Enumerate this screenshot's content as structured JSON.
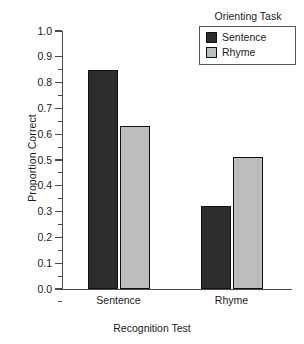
{
  "chart_data": {
    "type": "bar",
    "title": "",
    "xlabel": "Recognition Test",
    "ylabel": "Proportion Correct",
    "categories": [
      "Sentence",
      "Rhyme"
    ],
    "series": [
      {
        "name": "Sentence",
        "values": [
          0.85,
          0.32
        ],
        "color": "#2d2d2d"
      },
      {
        "name": "Rhyme",
        "values": [
          0.63,
          0.51
        ],
        "color": "#bdbdbd"
      }
    ],
    "ylim": [
      0.0,
      1.0
    ],
    "ytick_labels": [
      "0.0",
      "0.1",
      "0.2",
      "0.3",
      "0.4",
      "0.5",
      "0.6",
      "0.7",
      "0.8",
      "0.9",
      "1.0"
    ],
    "ytick_values": [
      0.0,
      0.1,
      0.2,
      0.3,
      0.4,
      0.5,
      0.6,
      0.7,
      0.8,
      0.9,
      1.0
    ],
    "minor_ticks": true,
    "grid": false,
    "legend": {
      "title": "Orienting Task",
      "position": "top-right",
      "entries": [
        {
          "label": "Sentence",
          "color": "#2d2d2d"
        },
        {
          "label": "Rhyme",
          "color": "#bdbdbd"
        }
      ]
    }
  },
  "axes": {
    "y_title": "Proportion Correct",
    "x_title": "Recognition Test",
    "y_ticks": [
      {
        "label": "1.0"
      },
      {
        "label": "0.9"
      },
      {
        "label": "0.8"
      },
      {
        "label": "0.7"
      },
      {
        "label": "0.6"
      },
      {
        "label": "0.5"
      },
      {
        "label": "0.4"
      },
      {
        "label": "0.3"
      },
      {
        "label": "0.2"
      },
      {
        "label": "0.1"
      },
      {
        "label": "0.0"
      }
    ],
    "x_categories": [
      {
        "label": "Sentence"
      },
      {
        "label": "Rhyme"
      }
    ]
  },
  "legend": {
    "title": "Orienting Task",
    "entries": [
      {
        "label": "Sentence"
      },
      {
        "label": "Rhyme"
      }
    ]
  }
}
